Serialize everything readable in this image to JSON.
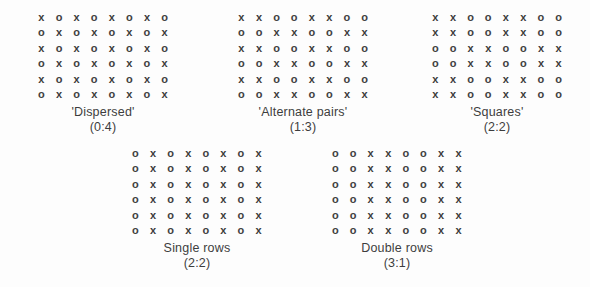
{
  "figure": {
    "background_color": "#fdfdfd",
    "glyph_color": "#3b3b3b",
    "caption_color": "#3d3d3d",
    "symbols": {
      "a": "x",
      "b": "o"
    }
  },
  "patterns": [
    {
      "id": "dispersed",
      "name": "'Dispersed'",
      "ratio": "(0:4)",
      "rows": [
        [
          "x",
          "o",
          "x",
          "o",
          "x",
          "o",
          "x",
          "o"
        ],
        [
          "o",
          "x",
          "o",
          "x",
          "o",
          "x",
          "o",
          "x"
        ],
        [
          "x",
          "o",
          "x",
          "o",
          "x",
          "o",
          "x",
          "o"
        ],
        [
          "o",
          "x",
          "o",
          "x",
          "o",
          "x",
          "o",
          "x"
        ],
        [
          "x",
          "o",
          "x",
          "o",
          "x",
          "o",
          "x",
          "o"
        ],
        [
          "o",
          "x",
          "o",
          "x",
          "o",
          "x",
          "o",
          "x"
        ]
      ]
    },
    {
      "id": "alternate-pairs",
      "name": "'Alternate pairs'",
      "ratio": "(1:3)",
      "rows": [
        [
          "x",
          "x",
          "o",
          "o",
          "x",
          "x",
          "o",
          "o"
        ],
        [
          "o",
          "o",
          "x",
          "x",
          "o",
          "o",
          "x",
          "x"
        ],
        [
          "x",
          "x",
          "o",
          "o",
          "x",
          "x",
          "o",
          "o"
        ],
        [
          "o",
          "o",
          "x",
          "x",
          "o",
          "o",
          "x",
          "x"
        ],
        [
          "x",
          "x",
          "o",
          "o",
          "x",
          "x",
          "o",
          "o"
        ],
        [
          "o",
          "o",
          "x",
          "x",
          "o",
          "o",
          "x",
          "x"
        ]
      ]
    },
    {
      "id": "squares",
      "name": "'Squares'",
      "ratio": "(2:2)",
      "rows": [
        [
          "x",
          "x",
          "o",
          "o",
          "x",
          "x",
          "o",
          "o"
        ],
        [
          "x",
          "x",
          "o",
          "o",
          "x",
          "x",
          "o",
          "o"
        ],
        [
          "o",
          "o",
          "x",
          "x",
          "o",
          "o",
          "x",
          "x"
        ],
        [
          "o",
          "o",
          "x",
          "x",
          "o",
          "o",
          "x",
          "x"
        ],
        [
          "x",
          "x",
          "o",
          "o",
          "x",
          "x",
          "o",
          "o"
        ],
        [
          "x",
          "x",
          "o",
          "o",
          "x",
          "x",
          "o",
          "o"
        ]
      ]
    },
    {
      "id": "single-rows",
      "name": "Single rows",
      "ratio": "(2:2)",
      "rows": [
        [
          "o",
          "x",
          "o",
          "x",
          "o",
          "x",
          "o",
          "x"
        ],
        [
          "o",
          "x",
          "o",
          "x",
          "o",
          "x",
          "o",
          "x"
        ],
        [
          "o",
          "x",
          "o",
          "x",
          "o",
          "x",
          "o",
          "x"
        ],
        [
          "o",
          "x",
          "o",
          "x",
          "o",
          "x",
          "o",
          "x"
        ],
        [
          "o",
          "x",
          "o",
          "x",
          "o",
          "x",
          "o",
          "x"
        ],
        [
          "o",
          "x",
          "o",
          "x",
          "o",
          "x",
          "o",
          "x"
        ]
      ]
    },
    {
      "id": "double-rows",
      "name": "Double rows",
      "ratio": "(3:1)",
      "rows": [
        [
          "o",
          "o",
          "x",
          "x",
          "o",
          "o",
          "x",
          "x"
        ],
        [
          "o",
          "o",
          "x",
          "x",
          "o",
          "o",
          "x",
          "x"
        ],
        [
          "o",
          "o",
          "x",
          "x",
          "o",
          "o",
          "x",
          "x"
        ],
        [
          "o",
          "o",
          "x",
          "x",
          "o",
          "o",
          "x",
          "x"
        ],
        [
          "o",
          "o",
          "x",
          "x",
          "o",
          "o",
          "x",
          "x"
        ],
        [
          "o",
          "o",
          "x",
          "x",
          "o",
          "o",
          "x",
          "x"
        ]
      ]
    }
  ]
}
